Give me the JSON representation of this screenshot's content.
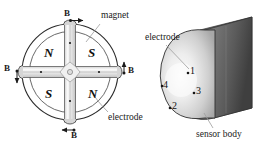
{
  "figure": {
    "left_view": {
      "poles": [
        {
          "label": "N",
          "quadrant": "upper-left"
        },
        {
          "label": "S",
          "quadrant": "upper-right"
        },
        {
          "label": "S",
          "quadrant": "lower-left"
        },
        {
          "label": "N",
          "quadrant": "lower-right"
        }
      ],
      "field_labels": [
        {
          "label": "B",
          "position": "top"
        },
        {
          "label": "B",
          "position": "left"
        },
        {
          "label": "B",
          "position": "right"
        },
        {
          "label": "B",
          "position": "bottom"
        }
      ],
      "callouts": [
        {
          "label": "magnet"
        },
        {
          "label": "electrode"
        }
      ]
    },
    "right_view": {
      "callouts": [
        {
          "label": "electrode"
        },
        {
          "label": "sensor body"
        }
      ],
      "electrode_numbers": [
        "1",
        "2",
        "3",
        "4"
      ]
    },
    "colors": {
      "outline": "#2b2b2b",
      "magnet_fill": "#e8e8e8",
      "body_light": "#f2f2f2",
      "body_mid": "#b9b9b9",
      "body_dark": "#4a4a4a",
      "leader": "#8c8c8c",
      "text": "#1a1a1a",
      "background": "#ffffff"
    }
  }
}
